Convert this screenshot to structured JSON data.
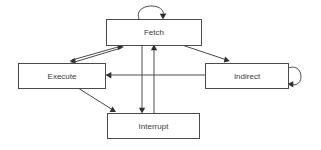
{
  "diagram": {
    "background_color": "#ffffff",
    "line_color": "#4a4a4a",
    "text_color": "#3a3a3a",
    "nodes": [
      {
        "id": "fetch",
        "label": "Fetch",
        "x": 106,
        "y": 19,
        "w": 95,
        "h": 26
      },
      {
        "id": "execute",
        "label": "Execute",
        "x": 18,
        "y": 63,
        "w": 87,
        "h": 25
      },
      {
        "id": "indirect",
        "label": "Indirect",
        "x": 205,
        "y": 63,
        "w": 83,
        "h": 25
      },
      {
        "id": "interrupt",
        "label": "Interrupt",
        "x": 107,
        "y": 113,
        "w": 92,
        "h": 25
      }
    ],
    "edges": [
      {
        "id": "fetch-self",
        "from": "fetch",
        "to": "fetch",
        "kind": "self-loop"
      },
      {
        "id": "indirect-self",
        "from": "indirect",
        "to": "indirect",
        "kind": "self-loop"
      },
      {
        "id": "fetch-to-execute",
        "from": "fetch",
        "to": "execute",
        "kind": "diagonal"
      },
      {
        "id": "execute-to-fetch",
        "from": "execute",
        "to": "fetch",
        "kind": "diagonal"
      },
      {
        "id": "fetch-to-indirect",
        "from": "fetch",
        "to": "indirect",
        "kind": "diagonal"
      },
      {
        "id": "indirect-to-execute",
        "from": "indirect",
        "to": "execute",
        "kind": "horizontal"
      },
      {
        "id": "fetch-to-interrupt",
        "from": "fetch",
        "to": "interrupt",
        "kind": "vertical"
      },
      {
        "id": "interrupt-to-fetch",
        "from": "interrupt",
        "to": "fetch",
        "kind": "vertical"
      },
      {
        "id": "execute-to-interrupt",
        "from": "execute",
        "to": "interrupt",
        "kind": "diagonal"
      }
    ]
  }
}
